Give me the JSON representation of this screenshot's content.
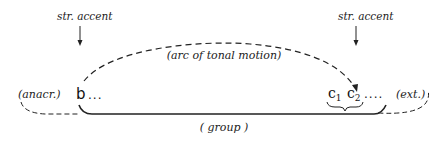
{
  "diagram": {
    "accents": [
      {
        "label": "str. accent",
        "target": "b"
      },
      {
        "label": "str. accent",
        "target": "c2"
      }
    ],
    "arc_label": "(arc of tonal motion)",
    "group_label": "( group )",
    "anacrusis_label": "(anacr.)",
    "extension_label": "(ext.)",
    "notes": {
      "b": "b",
      "b_trail": "...",
      "c1_base": "c",
      "c1_sub": "1",
      "c2_base": "c",
      "c2_sub": "2",
      "c_trail": "...."
    },
    "colors": {
      "ink": "#222222",
      "background": "#ffffff"
    }
  }
}
